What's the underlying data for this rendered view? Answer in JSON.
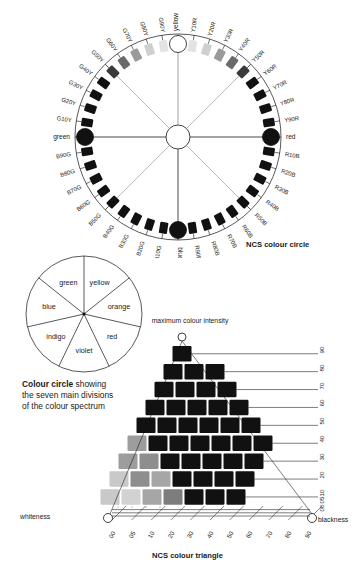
{
  "figure": {
    "ncs_circle": {
      "title": "NCS colour circle",
      "primaries": [
        {
          "name": "yellow",
          "angle": 90
        },
        {
          "name": "red",
          "angle": 0
        },
        {
          "name": "blue",
          "angle": 270
        },
        {
          "name": "green",
          "angle": 180
        }
      ],
      "notations_yellow_red": [
        "Y10R",
        "Y20R",
        "Y30R",
        "Y40R",
        "Y50R",
        "Y60R",
        "Y70R",
        "Y80R",
        "Y90R"
      ],
      "notations_red_blue": [
        "R10B",
        "R20B",
        "R30B",
        "R40B",
        "R50B",
        "R60B",
        "R70B",
        "R80B",
        "R90B"
      ],
      "notations_blue_green": [
        "B10G",
        "B20G",
        "B30G",
        "B40G",
        "B50G",
        "B60G",
        "B70G",
        "B80G",
        "B90G"
      ],
      "notations_green_yellow": [
        "G10Y",
        "G20Y",
        "G30Y",
        "G40Y",
        "G50Y",
        "G60Y",
        "G70Y",
        "G80Y",
        "G90Y"
      ]
    },
    "seven_circle": {
      "segments": [
        "yellow",
        "orange",
        "red",
        "violet",
        "indigo",
        "blue",
        "green"
      ],
      "caption_bold": "Colour circle",
      "caption_rest": "showing the seven main divisions of the colour spectrum"
    },
    "triangle": {
      "title": "NCS colour triangle",
      "top_label": "maximum colour intensity",
      "left_label": "whiteness",
      "right_label": "blackness",
      "chromaticness_ticks": [
        "90",
        "80",
        "70",
        "60",
        "50",
        "40",
        "30",
        "20",
        "10",
        "05",
        "00"
      ],
      "blackness_ticks": [
        "00",
        "05",
        "10",
        "20",
        "30",
        "40",
        "50",
        "60",
        "70",
        "80",
        "90"
      ],
      "rows": [
        1,
        3,
        4,
        5,
        6,
        7,
        7,
        7,
        7
      ]
    }
  },
  "colors": {
    "ink": "#111111",
    "paper": "#ffffff",
    "grey_light": "#b9b9b9",
    "grey_mid": "#8a8a8a",
    "grey_dark": "#4a4a4a"
  }
}
